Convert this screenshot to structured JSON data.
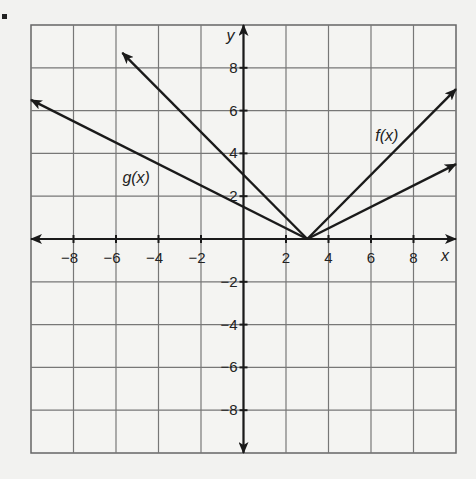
{
  "chart_data": {
    "type": "line",
    "title": "",
    "xlabel": "x",
    "ylabel": "y",
    "xlim": [
      -10,
      10
    ],
    "ylim": [
      -10,
      10
    ],
    "grid": true,
    "grid_step": 2,
    "x_ticks": [
      -8,
      -6,
      -4,
      -2,
      2,
      4,
      6,
      8
    ],
    "y_ticks": [
      8,
      6,
      4,
      2,
      -2,
      -4,
      -6,
      -8
    ],
    "series": [
      {
        "name": "f(x)",
        "equation": "|x - 3|",
        "points": [
          [
            -5.7,
            8.7
          ],
          [
            3,
            0
          ],
          [
            10,
            7
          ]
        ],
        "arrows": "both"
      },
      {
        "name": "g(x)",
        "equation": "0.5|x - 3|",
        "points": [
          [
            -10,
            6.5
          ],
          [
            3,
            0
          ],
          [
            10,
            3.5
          ]
        ],
        "arrows": "both"
      }
    ],
    "annotations": [
      {
        "text": "f(x)",
        "x": 6.2,
        "y": 4.6
      },
      {
        "text": "g(x)",
        "x": -5.7,
        "y": 2.6
      }
    ]
  },
  "labels": {
    "x_axis": "x",
    "y_axis": "y",
    "f_label": "f(x)",
    "g_label": "g(x)",
    "xticks": [
      "−8",
      "−6",
      "−4",
      "−2",
      "2",
      "4",
      "6",
      "8"
    ],
    "yticks": [
      "8",
      "6",
      "4",
      "2",
      "−2",
      "−4",
      "−6",
      "−8"
    ]
  }
}
